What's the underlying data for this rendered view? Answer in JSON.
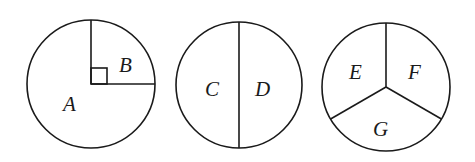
{
  "figure": {
    "circles": [
      {
        "id": "circle-1",
        "regions": [
          {
            "label": "A",
            "description": "three-quarter sector"
          },
          {
            "label": "B",
            "description": "quarter sector with right-angle marker"
          }
        ]
      },
      {
        "id": "circle-2",
        "regions": [
          {
            "label": "C",
            "description": "left half"
          },
          {
            "label": "D",
            "description": "right half"
          }
        ]
      },
      {
        "id": "circle-3",
        "regions": [
          {
            "label": "E",
            "description": "upper-left third"
          },
          {
            "label": "F",
            "description": "upper-right third"
          },
          {
            "label": "G",
            "description": "bottom third"
          }
        ]
      }
    ],
    "colors": {
      "stroke": "#1a1a1a",
      "background": "#ffffff"
    }
  }
}
